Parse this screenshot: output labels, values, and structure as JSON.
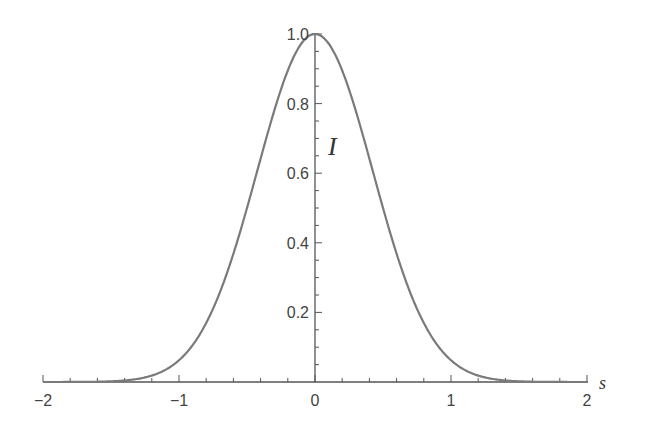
{
  "chart_data": {
    "type": "line",
    "title": "",
    "xlabel": "s",
    "ylabel": "I",
    "xlim": [
      -2,
      2
    ],
    "ylim": [
      0,
      1.0
    ],
    "grid": false,
    "legend": null,
    "x_ticks": [
      -2,
      -1,
      0,
      1,
      2
    ],
    "x_tick_labels": [
      "−2",
      "−1",
      "0",
      "1",
      "2"
    ],
    "x_minor_step": 0.2,
    "y_ticks": [
      0.2,
      0.4,
      0.6,
      0.8,
      1.0
    ],
    "y_tick_labels": [
      "0.2",
      "0.4",
      "0.6",
      "0.8",
      "1.0"
    ],
    "y_minor_step": 0.05,
    "series": [
      {
        "name": "I(s)",
        "color": "#7a7a7a",
        "x": [
          -2.0,
          -1.75,
          -1.5,
          -1.25,
          -1.0,
          -0.875,
          -0.75,
          -0.625,
          -0.5,
          -0.375,
          -0.25,
          -0.125,
          0.0,
          0.125,
          0.25,
          0.375,
          0.5,
          0.625,
          0.75,
          0.875,
          1.0,
          1.25,
          1.5,
          1.75,
          2.0
        ],
        "y": [
          0.0,
          0.002,
          0.008,
          0.02,
          0.05,
          0.1,
          0.2,
          0.34,
          0.5,
          0.67,
          0.84,
          0.96,
          1.0,
          0.96,
          0.84,
          0.67,
          0.5,
          0.34,
          0.2,
          0.1,
          0.05,
          0.02,
          0.008,
          0.002,
          0.0
        ]
      }
    ]
  },
  "colors": {
    "axis": "#555555",
    "curve": "#7a7a7a",
    "text": "#444444",
    "background": "#ffffff"
  }
}
